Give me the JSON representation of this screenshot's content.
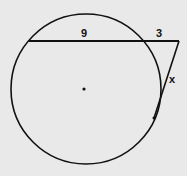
{
  "diagram": {
    "type": "circle-secant-tangent",
    "labels": {
      "chord_inside": "9",
      "external_segment": "3",
      "tangent": "x"
    },
    "colors": {
      "background": "#e9e9e9",
      "stroke": "#111111"
    }
  }
}
